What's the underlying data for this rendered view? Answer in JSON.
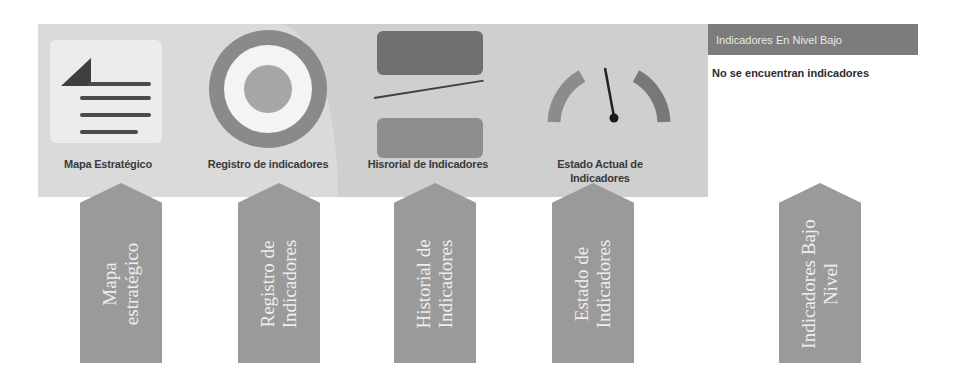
{
  "panel": {
    "tiles": [
      {
        "label": "Mapa Estratégico",
        "icon": "document-icon"
      },
      {
        "label": "Registro de indicadores",
        "icon": "target-icon"
      },
      {
        "label": "Hisrorial de Indicadores",
        "icon": "history-chart-icon"
      },
      {
        "label_line1": "Estado Actual de",
        "label_line2": "Indicadores",
        "icon": "gauge-icon"
      }
    ]
  },
  "widget": {
    "title": "Indicadores En Nivel Bajo",
    "empty_message": "No se encuentran indicadores"
  },
  "arrows": [
    {
      "line1": "Mapa",
      "line2": "estratégico"
    },
    {
      "line1": "Registro de",
      "line2": "Indicadores"
    },
    {
      "line1": "Historial de",
      "line2": "Indicadores"
    },
    {
      "line1": "Estado de",
      "line2": "Indicadores"
    },
    {
      "line1": "Indicadores Bajo",
      "line2": "Nivel"
    }
  ],
  "colors": {
    "panel_bg": "#cfcfcf",
    "panel_light": "#dadada",
    "widget_header": "#7c7c7c",
    "arrow_fill": "#9a9a9a"
  }
}
